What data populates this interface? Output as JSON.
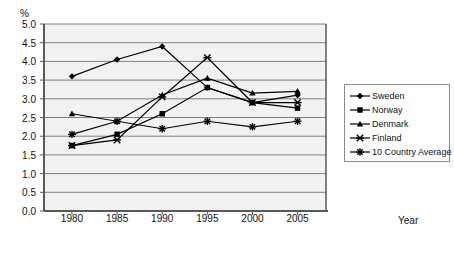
{
  "chart_data": {
    "type": "line",
    "title": "",
    "xlabel": "Year",
    "ylabel": "%",
    "categories": [
      "1980",
      "1985",
      "1990",
      "1995",
      "2000",
      "2005"
    ],
    "x": [
      1980,
      1985,
      1990,
      1995,
      2000,
      2005
    ],
    "xlim": [
      1977.5,
      2007.5
    ],
    "ylim": [
      0.0,
      5.0
    ],
    "yticks": [
      "0.0",
      "0.5",
      "1.0",
      "1.5",
      "2.0",
      "2.5",
      "3.0",
      "3.5",
      "4.0",
      "4.5",
      "5.0"
    ],
    "ytick_values": [
      0.0,
      0.5,
      1.0,
      1.5,
      2.0,
      2.5,
      3.0,
      3.5,
      4.0,
      4.5,
      5.0
    ],
    "grid": "horizontal",
    "legend_position": "right",
    "series": [
      {
        "name": "Sweden",
        "marker": "diamond",
        "values": [
          3.6,
          4.05,
          4.4,
          3.3,
          2.9,
          3.1
        ]
      },
      {
        "name": "Norway",
        "marker": "square",
        "values": [
          1.75,
          2.05,
          2.6,
          3.3,
          2.9,
          2.75
        ]
      },
      {
        "name": "Denmark",
        "marker": "triangle",
        "values": [
          2.6,
          2.4,
          3.1,
          3.55,
          3.15,
          3.2
        ]
      },
      {
        "name": "Finland",
        "marker": "x",
        "values": [
          1.75,
          1.9,
          3.05,
          4.1,
          2.9,
          2.9
        ]
      },
      {
        "name": "10 Country Average",
        "marker": "asterisk",
        "values": [
          2.05,
          2.4,
          2.2,
          2.4,
          2.25,
          2.4
        ]
      }
    ]
  },
  "legend": {
    "items": [
      {
        "label": "Sweden"
      },
      {
        "label": "Norway"
      },
      {
        "label": "Denmark"
      },
      {
        "label": "Finland"
      },
      {
        "label": "10 Country Average"
      }
    ]
  },
  "colors": {
    "series": "#000000",
    "grid": "#808080",
    "axis": "#595959",
    "plot_background": "#f2f2f2",
    "legend_border": "#8a8a8a",
    "text": "#111111"
  }
}
